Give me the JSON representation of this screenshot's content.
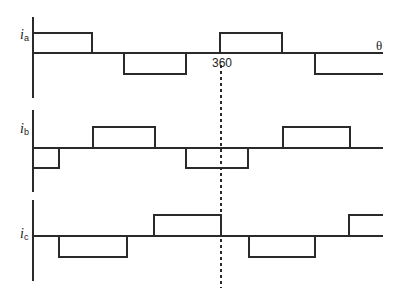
{
  "diagram": {
    "x_axis_symbol": "θ",
    "marker_label": "360",
    "colors": {
      "line": "#2a2a2a",
      "background": "#ffffff"
    },
    "phases": [
      {
        "id": "a",
        "symbol": "i",
        "subscript": "a"
      },
      {
        "id": "b",
        "symbol": "i",
        "subscript": "b"
      },
      {
        "id": "c",
        "symbol": "i",
        "subscript": "c"
      }
    ]
  }
}
